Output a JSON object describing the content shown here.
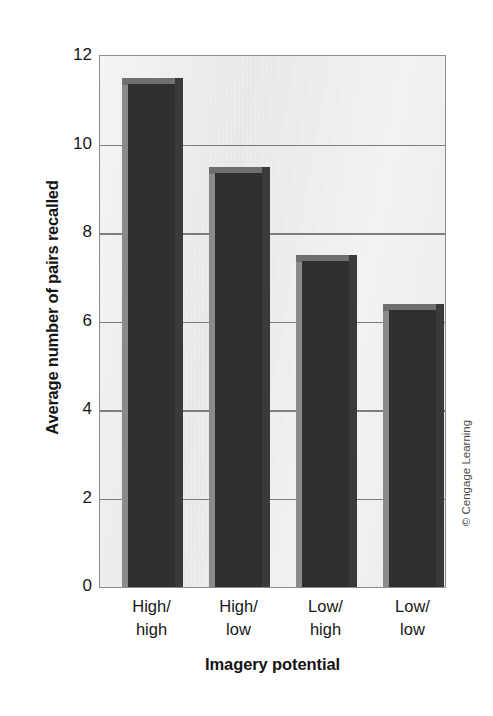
{
  "chart_data": {
    "type": "bar",
    "title": "",
    "xlabel": "Imagery potential",
    "ylabel": "Average number of pairs recalled",
    "categories": [
      "High/\nhigh",
      "High/\nlow",
      "Low/\nhigh",
      "Low/\nlow"
    ],
    "category_lines": [
      [
        "High/",
        "high"
      ],
      [
        "High/",
        "low"
      ],
      [
        "Low/",
        "high"
      ],
      [
        "Low/",
        "low"
      ]
    ],
    "values": [
      11.5,
      9.5,
      7.5,
      6.4
    ],
    "ylim": [
      0,
      12
    ],
    "ytick_labels": [
      "12",
      "10",
      "8",
      "6",
      "4",
      "2",
      "0"
    ],
    "ytick_values": [
      12,
      10,
      8,
      6,
      4,
      2,
      0
    ],
    "grid": true,
    "legend": "none",
    "bar_color": "#2f2f2f",
    "bar_side_light": "#8a8a8a",
    "bar_top_color": "#6f6f6f",
    "plot_background": "#e9e9e7",
    "gridline_color": "#7d7d7d",
    "axis_color": "#8d8d8d"
  },
  "credit": {
    "text": "© Cengage Learning"
  }
}
